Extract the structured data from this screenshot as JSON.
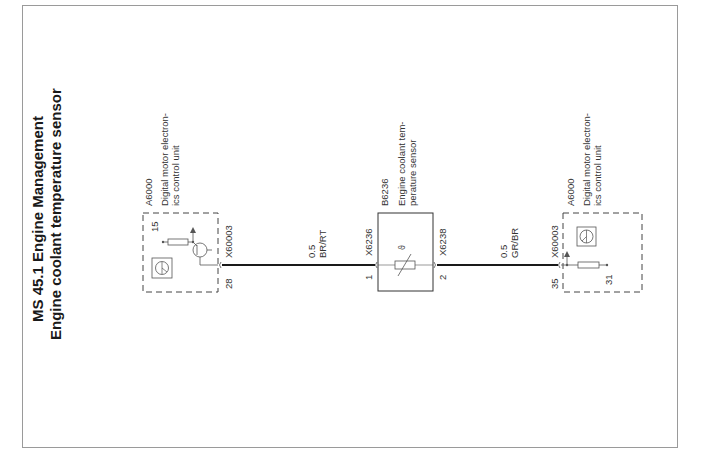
{
  "title": {
    "line1": "MS 45.1 Engine Management",
    "line2": "Engine coolant temperature sensor"
  },
  "components": {
    "ecu_left": {
      "id": "A6000",
      "desc_line1": "Digital motor electron-",
      "desc_line2": "ics control unit",
      "connector": "X60003",
      "pin_out": "28",
      "pin_supply": "15"
    },
    "sensor": {
      "id": "B6236",
      "desc_line1": "Engine coolant tem-",
      "desc_line2": "perature sensor",
      "connector_in": "X6236",
      "connector_out": "X6238",
      "pin_in": "1",
      "pin_out": "2"
    },
    "ecu_right": {
      "id": "A6000",
      "desc_line1": "Digital motor electron-",
      "desc_line2": "ics control unit",
      "connector": "X60003",
      "pin_in": "35",
      "pin_ground": "31"
    }
  },
  "wires": [
    {
      "gauge": "0.5",
      "color_code": "BR/RT"
    },
    {
      "gauge": "0.5",
      "color_code": "GR/BR"
    }
  ],
  "colors": {
    "wire": "#1a1a1a",
    "symbol": "#555555",
    "frame": "#9a9a9a"
  }
}
